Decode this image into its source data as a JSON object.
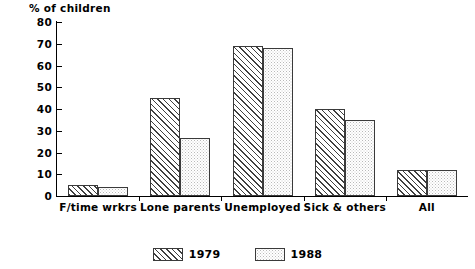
{
  "chart_data": {
    "type": "bar",
    "title": "% of children",
    "xlabel": "",
    "ylabel": "% of children",
    "ylim": [
      0,
      80
    ],
    "yticks": [
      0,
      10,
      20,
      30,
      40,
      50,
      60,
      70,
      80
    ],
    "grid": false,
    "legend_position": "bottom-center",
    "categories": [
      "F/time wrkrs",
      "Lone parents",
      "Unemployed",
      "Sick & others",
      "All"
    ],
    "series": [
      {
        "name": "1979",
        "pattern": "diagonal-hatch",
        "values": [
          5,
          45,
          69,
          40,
          12
        ]
      },
      {
        "name": "1988",
        "pattern": "dotted-stipple",
        "values": [
          4,
          26.5,
          68,
          35,
          12
        ]
      }
    ]
  },
  "axis": {
    "title": "% of children",
    "tick_labels": [
      "80",
      "70",
      "60",
      "50",
      "40",
      "30",
      "20",
      "10",
      "0"
    ]
  },
  "legend": {
    "items": [
      {
        "label": "1979"
      },
      {
        "label": "1988"
      }
    ]
  },
  "colors": {
    "background": "#ffffff",
    "axis": "#000000",
    "series_1979_line": "#3f3f3f",
    "series_1988_dot": "#bdbdbd"
  }
}
